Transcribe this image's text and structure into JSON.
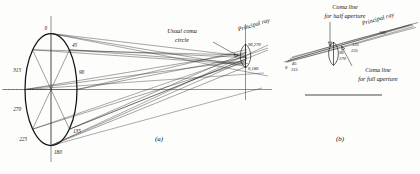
{
  "figure": {
    "background": "#fdfdfc",
    "ink": "#111111"
  },
  "panel_a": {
    "label": "(a)",
    "pupil_zone_labels": [
      "0",
      "45",
      "90",
      "135",
      "180",
      "225",
      "270",
      "315"
    ],
    "annotations": {
      "usual_coma_circle_line1": "Usual coma",
      "usual_coma_circle_line2": "circle",
      "principal_ray": "Principal ray",
      "coma_top": "90,270",
      "coma_bottom": "0,180"
    }
  },
  "panel_b": {
    "label": "(b)",
    "annotations": {
      "half_aperture_line1": "Coma line",
      "half_aperture_line2": "for half aperture",
      "full_aperture_line1": "Coma line",
      "full_aperture_line2": "for full aperture",
      "principal_ray": "Principal ray"
    },
    "zone_labels": {
      "far_left_0": "0",
      "far_left_45": "45",
      "far_left_315": "315",
      "loop_90": "90",
      "loop_270": "270",
      "mid_135": "135",
      "mid_225": "225",
      "apex_180": "180"
    }
  }
}
